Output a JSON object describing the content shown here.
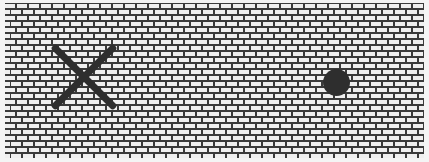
{
  "board": {
    "pattern": "brick",
    "colors": {
      "brick": "#efefef",
      "mortar": "#3a3a3a",
      "background": "#f4f4f4",
      "piece": "#2e2e2e"
    }
  },
  "pieces": [
    {
      "type": "x",
      "name": "x-mark",
      "cx": 84,
      "cy": 77,
      "size": 64
    },
    {
      "type": "o",
      "name": "o-mark",
      "cx": 336,
      "cy": 82,
      "diameter": 27
    }
  ]
}
